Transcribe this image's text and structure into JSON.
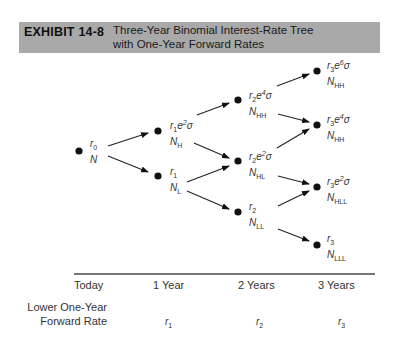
{
  "header": {
    "exhibit_number": "EXHIBIT 14-8",
    "title_line1": "Three-Year Binomial Interest-Rate Tree",
    "title_line2": "with One-Year Forward Rates",
    "background_color": "#a9a9a9"
  },
  "nodes": {
    "today": {
      "rate": "r",
      "rate_sub": "0",
      "exp": "",
      "n": "N",
      "n_sub": ""
    },
    "y1_up": {
      "rate": "r",
      "rate_sub": "1",
      "exp": "e",
      "exp_sup": "2",
      "sigma": "σ",
      "n": "N",
      "n_sub": "H"
    },
    "y1_down": {
      "rate": "r",
      "rate_sub": "1",
      "n": "N",
      "n_sub": "L"
    },
    "y2_up": {
      "rate": "r",
      "rate_sub": "2",
      "exp": "e",
      "exp_sup": "4",
      "sigma": "σ",
      "n": "N",
      "n_sub": "HH"
    },
    "y2_mid": {
      "rate": "r",
      "rate_sub": "2",
      "exp": "e",
      "exp_sup": "2",
      "sigma": "σ",
      "n": "N",
      "n_sub": "HL"
    },
    "y2_down": {
      "rate": "r",
      "rate_sub": "2",
      "n": "N",
      "n_sub": "LL"
    },
    "y3_1": {
      "rate": "r",
      "rate_sub": "3",
      "exp": "e",
      "exp_sup": "6",
      "sigma": "σ",
      "n": "N",
      "n_sub": "HH"
    },
    "y3_2": {
      "rate": "r",
      "rate_sub": "3",
      "exp": "e",
      "exp_sup": "4",
      "sigma": "σ",
      "n": "N",
      "n_sub": "HH"
    },
    "y3_3": {
      "rate": "r",
      "rate_sub": "3",
      "exp": "e",
      "exp_sup": "2",
      "sigma": "σ",
      "n": "N",
      "n_sub": "HLL"
    },
    "y3_4": {
      "rate": "r",
      "rate_sub": "3",
      "n": "N",
      "n_sub": "LLL"
    }
  },
  "axis": {
    "labels": [
      "Today",
      "1 Year",
      "2 Years",
      "3 Years"
    ]
  },
  "forward_rate": {
    "label_line1": "Lower One-Year",
    "label_line2": "Forward Rate",
    "values": [
      {
        "r": "r",
        "sub": "1"
      },
      {
        "r": "r",
        "sub": "2"
      },
      {
        "r": "r",
        "sub": "3"
      }
    ]
  }
}
